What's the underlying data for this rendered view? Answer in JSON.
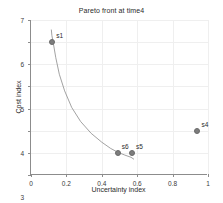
{
  "chart_data": {
    "type": "scatter",
    "title": "Pareto front at time4",
    "xlabel": "Uncertainty index",
    "ylabel": "Cost index",
    "xlim": [
      0,
      1
    ],
    "ylim": [
      0,
      7
    ],
    "grid": true,
    "legend": "none",
    "xticks": [
      "0",
      "0.2",
      "0.4",
      "0.6",
      "0.8",
      "1"
    ],
    "xtick_values": [
      0,
      0.2,
      0.4,
      0.6,
      0.8,
      1
    ],
    "yticks": [
      "0",
      "1",
      "2",
      "3",
      "4",
      "5",
      "6",
      "7"
    ],
    "ytick_values": [
      0,
      1,
      2,
      3,
      4,
      5,
      6,
      7
    ],
    "points": [
      {
        "label": "s1",
        "x": 0.12,
        "y": 6.0
      },
      {
        "label": "s6",
        "x": 0.49,
        "y": 1.0
      },
      {
        "label": "s5",
        "x": 0.57,
        "y": 1.0
      },
      {
        "label": "s4",
        "x": 0.94,
        "y": 2.0
      }
    ],
    "series": [
      {
        "name": "pareto-front-curve",
        "type": "line",
        "x": [
          0.115,
          0.118,
          0.125,
          0.14,
          0.16,
          0.19,
          0.23,
          0.28,
          0.34,
          0.4,
          0.45,
          0.49,
          0.53,
          0.565,
          0.58
        ],
        "y": [
          6.55,
          6.3,
          6.0,
          5.3,
          4.55,
          3.8,
          3.05,
          2.42,
          1.88,
          1.48,
          1.2,
          1.03,
          0.9,
          0.8,
          0.72
        ]
      }
    ],
    "marker_color": "#7d7d7d",
    "curve_color": "#8a8a8a",
    "grid_color": "#efefef",
    "axis_color": "#8c8c8c",
    "background_color": "#ffffff"
  }
}
